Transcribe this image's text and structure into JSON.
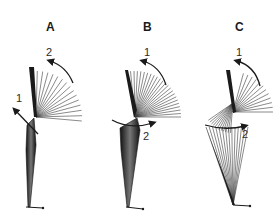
{
  "figure": {
    "panels": [
      {
        "id": "A",
        "label": "A",
        "label_pos": [
          51,
          31
        ],
        "arrows": [
          {
            "label": "2",
            "label_pos": [
              48,
              56
            ],
            "kind": "arc",
            "from": [
              50,
              61
            ],
            "to": [
              73,
              83
            ],
            "ctrl": [
              66,
              66
            ],
            "head": "start"
          },
          {
            "label": "1",
            "label_pos": [
              16,
              102
            ],
            "kind": "line",
            "from": [
              15,
              110
            ],
            "to": [
              38,
              134
            ],
            "head": "start"
          }
        ],
        "fan": {
          "origin": [
            36,
            117
          ],
          "count": 16,
          "radius": 46,
          "start_deg": -95,
          "end_deg": 5,
          "bold_end": true
        },
        "upper_segment": [
          [
            29,
            67
          ],
          [
            34,
            67
          ],
          [
            37,
            117
          ],
          [
            34,
            117
          ]
        ],
        "lower_segment": [
          [
            27,
            125
          ],
          [
            34,
            118
          ],
          [
            36,
            145
          ],
          [
            30,
            207
          ],
          [
            28,
            207
          ],
          [
            26,
            150
          ]
        ],
        "foot": [
          [
            26,
            207
          ],
          [
            43,
            208
          ]
        ]
      },
      {
        "id": "B",
        "label": "B",
        "label_pos": [
          148,
          31
        ],
        "arrows": [
          {
            "label": "1",
            "label_pos": [
              145,
              56
            ],
            "kind": "arc",
            "from": [
              143,
              61
            ],
            "to": [
              166,
              85
            ],
            "ctrl": [
              160,
              66
            ],
            "head": "start"
          },
          {
            "label": "2",
            "label_pos": [
              144,
              140
            ],
            "kind": "curve",
            "from": [
              112,
              120
            ],
            "to": [
              153,
              123
            ],
            "ctrl": [
              130,
              130
            ],
            "head": "end"
          }
        ],
        "fan": {
          "origin": [
            135,
            117
          ],
          "count": 24,
          "radius": 46,
          "start_deg": -100,
          "end_deg": 0,
          "bold_end": true
        },
        "upper_segment": [
          [
            125,
            70
          ],
          [
            128,
            70
          ],
          [
            137,
            110
          ],
          [
            134,
            118
          ]
        ],
        "lower_segment": [
          [
            120,
            128
          ],
          [
            137,
            118
          ],
          [
            140,
            130
          ],
          [
            129,
            207
          ],
          [
            127,
            207
          ],
          [
            121,
            150
          ]
        ],
        "foot": [
          [
            126,
            207
          ],
          [
            143,
            209
          ]
        ]
      },
      {
        "id": "C",
        "label": "C",
        "label_pos": [
          240,
          31
        ],
        "arrows": [
          {
            "label": "1",
            "label_pos": [
              237,
              56
            ],
            "kind": "arc",
            "from": [
              237,
              61
            ],
            "to": [
              260,
              86
            ],
            "ctrl": [
              255,
              66
            ],
            "head": "start"
          },
          {
            "label": "2",
            "label_pos": [
              242,
              138
            ],
            "kind": "curve",
            "from": [
              205,
              125
            ],
            "to": [
              245,
              126
            ],
            "ctrl": [
              225,
              131
            ],
            "head": "end"
          }
        ],
        "fan": {
          "origin": [
            233,
            112
          ],
          "count": 12,
          "radius": 40,
          "start_deg": -75,
          "end_deg": 0,
          "bold_end": true
        },
        "upper_segment": [
          [
            226,
            70
          ],
          [
            230,
            70
          ],
          [
            236,
            112
          ],
          [
            233,
            113
          ]
        ],
        "lower_cone": {
          "apex": [
            233,
            205
          ],
          "top_y": 127,
          "top_x_min": 206,
          "top_x_max": 248,
          "count": 14
        },
        "knee_fan": {
          "origin": [
            233,
            103
          ],
          "count": 12,
          "radius": 30,
          "start_deg": 145,
          "end_deg": 95
        },
        "foot": [
          [
            233,
            205
          ],
          [
            250,
            206
          ]
        ]
      }
    ]
  }
}
